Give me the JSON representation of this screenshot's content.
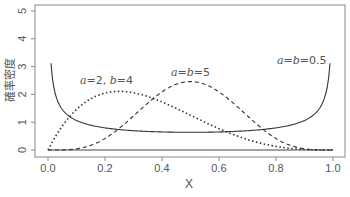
{
  "chart_data": {
    "type": "line",
    "title": "",
    "xlabel": "X",
    "ylabel": "確率密度",
    "xlim": [
      0,
      1
    ],
    "ylim": [
      0,
      5
    ],
    "x_ticks": [
      "0.0",
      "0.2",
      "0.4",
      "0.6",
      "0.8",
      "1.0"
    ],
    "y_ticks": [
      "0",
      "1",
      "2",
      "3",
      "4",
      "5"
    ],
    "grid": false,
    "legend": "none (inline annotations)",
    "series": [
      {
        "name": "a=b=0.5",
        "distribution": "Beta(0.5,0.5)",
        "line_style": "solid",
        "a": 0.5,
        "b": 0.5,
        "sample_points": [
          [
            0.01,
            3.2
          ],
          [
            0.1,
            1.06
          ],
          [
            0.25,
            0.74
          ],
          [
            0.5,
            0.64
          ],
          [
            0.75,
            0.74
          ],
          [
            0.9,
            1.06
          ],
          [
            0.99,
            3.2
          ]
        ]
      },
      {
        "name": "a=2, b=4",
        "distribution": "Beta(2,4)",
        "line_style": "dotted",
        "a": 2,
        "b": 4,
        "sample_points": [
          [
            0,
            0
          ],
          [
            0.1,
            1.46
          ],
          [
            0.25,
            2.11
          ],
          [
            0.4,
            1.73
          ],
          [
            0.6,
            0.77
          ],
          [
            0.8,
            0.13
          ],
          [
            1,
            0
          ]
        ]
      },
      {
        "name": "a=b=5",
        "distribution": "Beta(5,5)",
        "line_style": "dashed",
        "a": 5,
        "b": 5,
        "sample_points": [
          [
            0,
            0
          ],
          [
            0.2,
            0.26
          ],
          [
            0.3,
            1.36
          ],
          [
            0.5,
            2.46
          ],
          [
            0.7,
            1.36
          ],
          [
            0.8,
            0.26
          ],
          [
            1,
            0
          ]
        ]
      }
    ],
    "annotations": [
      {
        "text": "a=2, b=4",
        "x": 0.25,
        "y": 2.4
      },
      {
        "text": "a=b=5",
        "x": 0.49,
        "y": 2.75
      },
      {
        "text": "a=b=0.5",
        "x": 0.9,
        "y": 3.4
      }
    ]
  },
  "labels": {
    "xlabel": "X",
    "ylabel": "確率密度",
    "ann1_a": "a",
    "ann1_eq": "=2, ",
    "ann1_b": "b",
    "ann1_v": "=4",
    "ann2_a": "a",
    "ann2_eq": "=",
    "ann2_b": "b",
    "ann2_v": "=5",
    "ann3_a": "a",
    "ann3_eq": "=",
    "ann3_b": "b",
    "ann3_v": "=0.5"
  }
}
